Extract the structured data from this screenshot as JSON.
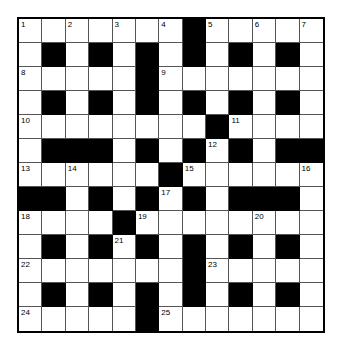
{
  "puzzle": {
    "rows": 13,
    "cols": 13,
    "colors": {
      "block": "#000000",
      "cell": "#ffffff",
      "gridline": "#555555"
    },
    "layout": [
      ".......#.....",
      ".#.#.#.#.#.#.",
      ".....#.......",
      ".#.#.#.#.#.#.",
      "........#....",
      ".###.#.#.#.##",
      "......#......",
      "##.#.#.#.###.",
      "....#........",
      ".#.#.#.#.#.#.",
      ".......#.....",
      ".#.#.#.#.#.#.",
      ".....#......."
    ],
    "numbers": [
      {
        "n": "1",
        "r": 0,
        "c": 0
      },
      {
        "n": "2",
        "r": 0,
        "c": 2
      },
      {
        "n": "3",
        "r": 0,
        "c": 4
      },
      {
        "n": "4",
        "r": 0,
        "c": 6
      },
      {
        "n": "5",
        "r": 0,
        "c": 8
      },
      {
        "n": "6",
        "r": 0,
        "c": 10
      },
      {
        "n": "7",
        "r": 0,
        "c": 12
      },
      {
        "n": "8",
        "r": 2,
        "c": 0
      },
      {
        "n": "9",
        "r": 2,
        "c": 6
      },
      {
        "n": "10",
        "r": 4,
        "c": 0
      },
      {
        "n": "11",
        "r": 4,
        "c": 9
      },
      {
        "n": "12",
        "r": 5,
        "c": 8
      },
      {
        "n": "13",
        "r": 6,
        "c": 0
      },
      {
        "n": "14",
        "r": 6,
        "c": 2
      },
      {
        "n": "15",
        "r": 6,
        "c": 7
      },
      {
        "n": "16",
        "r": 6,
        "c": 12
      },
      {
        "n": "17",
        "r": 7,
        "c": 6
      },
      {
        "n": "18",
        "r": 8,
        "c": 0
      },
      {
        "n": "19",
        "r": 8,
        "c": 5
      },
      {
        "n": "20",
        "r": 8,
        "c": 10
      },
      {
        "n": "21",
        "r": 9,
        "c": 4
      },
      {
        "n": "22",
        "r": 10,
        "c": 0
      },
      {
        "n": "23",
        "r": 10,
        "c": 8
      },
      {
        "n": "24",
        "r": 12,
        "c": 0
      },
      {
        "n": "25",
        "r": 12,
        "c": 6
      }
    ]
  }
}
